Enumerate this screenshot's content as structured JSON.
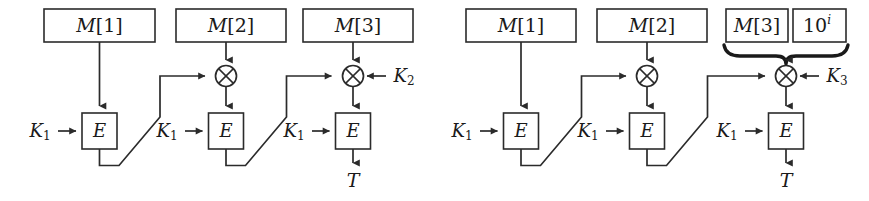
{
  "figure": {
    "caption": "",
    "background_color": "#ffffff",
    "ink_color": "#1a1a1a",
    "panels": [
      {
        "id": "left",
        "name": "cbc-mac-three-block-k2",
        "stages": [
          {
            "index": 1,
            "message_label": "M[1]",
            "message_label_base": "M",
            "message_label_index": "[1]",
            "key_label": "K",
            "key_subscript": "1",
            "cipher_label": "E",
            "has_xor": false,
            "xor_side_label": "",
            "xor_side_subscript": "",
            "output_label": ""
          },
          {
            "index": 2,
            "message_label": "M[2]",
            "message_label_base": "M",
            "message_label_index": "[2]",
            "key_label": "K",
            "key_subscript": "1",
            "cipher_label": "E",
            "has_xor": true,
            "xor_side_label": "",
            "xor_side_subscript": "",
            "output_label": ""
          },
          {
            "index": 3,
            "message_label": "M[3]",
            "message_label_base": "M",
            "message_label_index": "[3]",
            "key_label": "K",
            "key_subscript": "1",
            "cipher_label": "E",
            "has_xor": true,
            "xor_side_label": "K",
            "xor_side_subscript": "2",
            "output_label": "T"
          }
        ],
        "pad_block": null
      },
      {
        "id": "right",
        "name": "cbc-mac-padded-k3",
        "stages": [
          {
            "index": 1,
            "message_label": "M[1]",
            "message_label_base": "M",
            "message_label_index": "[1]",
            "key_label": "K",
            "key_subscript": "1",
            "cipher_label": "E",
            "has_xor": false,
            "xor_side_label": "",
            "xor_side_subscript": "",
            "output_label": ""
          },
          {
            "index": 2,
            "message_label": "M[2]",
            "message_label_base": "M",
            "message_label_index": "[2]",
            "key_label": "K",
            "key_subscript": "1",
            "cipher_label": "E",
            "has_xor": true,
            "xor_side_label": "",
            "xor_side_subscript": "",
            "output_label": ""
          },
          {
            "index": 3,
            "message_label": "M[3]",
            "message_label_base": "M",
            "message_label_index": "[3]",
            "key_label": "K",
            "key_subscript": "1",
            "cipher_label": "E",
            "has_xor": true,
            "xor_side_label": "K",
            "xor_side_subscript": "3",
            "output_label": "T"
          }
        ],
        "pad_block": {
          "label": "10^i",
          "mantissa": "10",
          "exponent": "i",
          "has_brace": true
        }
      }
    ],
    "icons": [
      "xor-circle-icon",
      "arrowhead-icon",
      "brace-icon"
    ]
  }
}
